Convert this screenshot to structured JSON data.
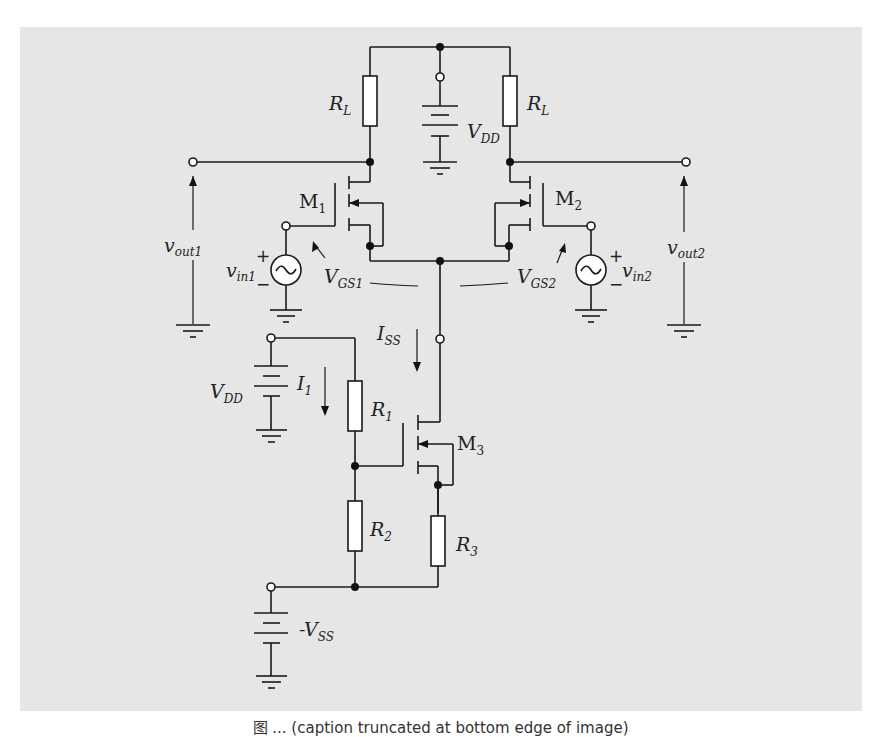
{
  "figure": {
    "type": "circuit-schematic",
    "background_color": "#e6e6e6",
    "caption": "图 ... (caption truncated at bottom edge of image)"
  },
  "labels": {
    "rl_left": {
      "main": "R",
      "sub": "L"
    },
    "rl_right": {
      "main": "R",
      "sub": "L"
    },
    "vdd_top": {
      "main": "V",
      "sub": "DD"
    },
    "m1": {
      "main": "M",
      "sub": "1"
    },
    "m2": {
      "main": "M",
      "sub": "2"
    },
    "m3": {
      "main": "M",
      "sub": "3"
    },
    "vout1": {
      "main": "v",
      "sub": "out1"
    },
    "vout2": {
      "main": "v",
      "sub": "out2"
    },
    "vin1": {
      "main": "v",
      "sub": "in1"
    },
    "vin2": {
      "main": "v",
      "sub": "in2"
    },
    "vgs1": {
      "main": "V",
      "sub": "GS1"
    },
    "vgs2": {
      "main": "V",
      "sub": "GS2"
    },
    "iss": {
      "main": "I",
      "sub": "SS"
    },
    "i1": {
      "main": "I",
      "sub": "1"
    },
    "vdd_bias": {
      "main": "V",
      "sub": "DD"
    },
    "r1": {
      "main": "R",
      "sub": "1"
    },
    "r2": {
      "main": "R",
      "sub": "2"
    },
    "r3": {
      "main": "R",
      "sub": "3"
    },
    "vss": {
      "prefix": "-",
      "main": "V",
      "sub": "SS"
    },
    "plus": "+",
    "minus": "−"
  },
  "components": [
    {
      "id": "RL_left",
      "kind": "resistor"
    },
    {
      "id": "RL_right",
      "kind": "resistor"
    },
    {
      "id": "VDD_top",
      "kind": "battery"
    },
    {
      "id": "M1",
      "kind": "nmos"
    },
    {
      "id": "M2",
      "kind": "nmos"
    },
    {
      "id": "M3",
      "kind": "nmos",
      "role": "current-source"
    },
    {
      "id": "vin1",
      "kind": "ac-source"
    },
    {
      "id": "vin2",
      "kind": "ac-source"
    },
    {
      "id": "VDD_bias",
      "kind": "battery"
    },
    {
      "id": "R1",
      "kind": "resistor"
    },
    {
      "id": "R2",
      "kind": "resistor"
    },
    {
      "id": "R3",
      "kind": "resistor"
    },
    {
      "id": "VSS",
      "kind": "battery"
    }
  ]
}
